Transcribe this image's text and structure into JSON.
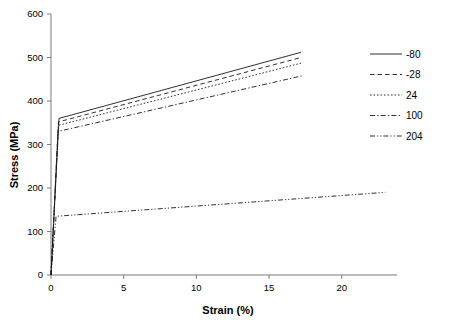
{
  "chart_data": {
    "type": "line",
    "title": "",
    "xlabel": "Strain (%)",
    "ylabel": "Stress (MPa)",
    "xlim": [
      0,
      23.8
    ],
    "ylim": [
      0,
      600
    ],
    "xticks": [
      0,
      5,
      10,
      15,
      20
    ],
    "yticks": [
      0,
      100,
      200,
      300,
      400,
      500,
      600
    ],
    "grid": false,
    "legend_position": "right",
    "legend_title": "",
    "series": [
      {
        "name": "-80",
        "style": "solid",
        "x": [
          0,
          0.55,
          17.2
        ],
        "y": [
          0,
          360,
          512
        ]
      },
      {
        "name": "-28",
        "style": "dashed",
        "x": [
          0,
          0.52,
          17.2
        ],
        "y": [
          0,
          352,
          500
        ]
      },
      {
        "name": "24",
        "style": "dotted",
        "x": [
          0,
          0.5,
          17.2
        ],
        "y": [
          0,
          344,
          487
        ]
      },
      {
        "name": "100",
        "style": "dashdot",
        "x": [
          0,
          0.48,
          17.3
        ],
        "y": [
          0,
          330,
          458
        ]
      },
      {
        "name": "204",
        "style": "dashdotdot",
        "x": [
          0,
          0.35,
          23.0
        ],
        "y": [
          0,
          135,
          190
        ]
      }
    ]
  },
  "axes": {
    "x_title": "Strain (%)",
    "y_title": "Stress (MPa)",
    "x_tick_labels": [
      "0",
      "5",
      "10",
      "15",
      "20"
    ],
    "y_tick_labels": [
      "0",
      "100",
      "200",
      "300",
      "400",
      "500",
      "600"
    ]
  },
  "legend": {
    "items": [
      {
        "label": "-80",
        "style": "solid"
      },
      {
        "label": "-28",
        "style": "dashed"
      },
      {
        "label": "24",
        "style": "dotted"
      },
      {
        "label": "100",
        "style": "dashdot"
      },
      {
        "label": "204",
        "style": "dashdotdot"
      }
    ]
  },
  "colors": {
    "line": "#1a1a1a",
    "axis": "#7a7a7a",
    "text": "#000000",
    "background": "#ffffff"
  }
}
